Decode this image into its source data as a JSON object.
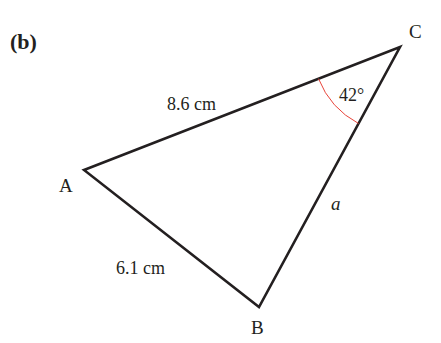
{
  "part_label": "(b)",
  "triangle": {
    "vertices": {
      "A": {
        "label": "A"
      },
      "B": {
        "label": "B"
      },
      "C": {
        "label": "C"
      }
    },
    "sides": {
      "AC": {
        "label": "8.6 cm"
      },
      "AB": {
        "label": "6.1 cm"
      },
      "BC": {
        "label": "a"
      }
    },
    "angle_C": {
      "label": "42°",
      "arc_color": "#e8443a"
    }
  },
  "colors": {
    "line": "#231f20",
    "arc": "#e8443a",
    "background": "#ffffff"
  }
}
